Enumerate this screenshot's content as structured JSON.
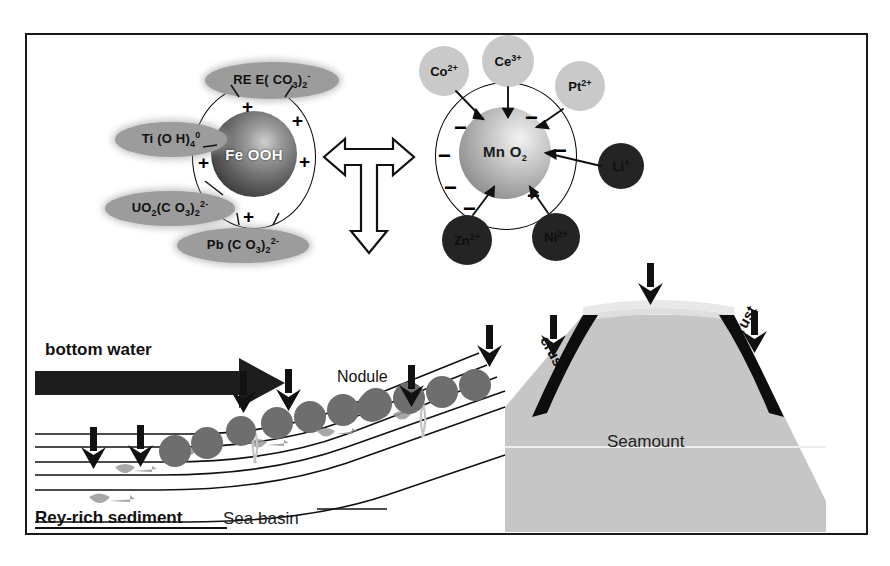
{
  "figure": {
    "border_color": "#1a1a1a"
  },
  "upper_panel": {
    "left_sphere": {
      "core_label": "Fe OOH",
      "surface_charge": "+",
      "charge_count": 5,
      "species": [
        {
          "id": "ree",
          "formula": "REE(CO3)2-",
          "display": "RE E( CO 3)2 -"
        },
        {
          "id": "ti",
          "formula": "Ti(OH)4 0",
          "display": "Ti (O H) 4 0"
        },
        {
          "id": "uo2",
          "formula": "UO2(CO3)2 2-",
          "display": "UO 2(C O 3)2 2-"
        },
        {
          "id": "pb",
          "formula": "Pb(CO3)2 2-",
          "display": "Pb (C O 3)2 2-"
        }
      ]
    },
    "right_sphere": {
      "core_label": "Mn O2",
      "surface_charge": "-",
      "charge_count": 7,
      "species": [
        {
          "id": "co",
          "formula": "Co 2+",
          "shade": "light"
        },
        {
          "id": "ce",
          "formula": "Ce 3+",
          "shade": "light"
        },
        {
          "id": "pt",
          "formula": "Pt 2+",
          "shade": "light"
        },
        {
          "id": "li",
          "formula": "Li +",
          "shade": "dark"
        },
        {
          "id": "zn",
          "formula": "Zn 2+",
          "shade": "dark"
        },
        {
          "id": "ni",
          "formula": "Ni 2+",
          "shade": "dark"
        }
      ]
    },
    "connector": {
      "type": "hollow-tee-arrow",
      "directions": [
        "left",
        "right",
        "down"
      ]
    }
  },
  "lower_panel": {
    "bottom_water_label": "bottom water",
    "nodule_label": "Nodule",
    "seamount_label": "Seamount",
    "crust_label_left": "crust",
    "crust_label_right": "crust",
    "sediment_label": "Rey-rich sediment",
    "basin_label": "Sea basin",
    "settling_arrow_count": 9,
    "nodule_count": 11,
    "colors": {
      "seamount": "#c6c6c6",
      "seamount_cap": "#dedede",
      "crust": "#0d0d0d",
      "nodule": "#6e6e6e",
      "bottom_water_arrow": "#1d1d1d"
    }
  },
  "labels": {
    "fe_core": "Fe OOH",
    "mn_core": "Mn O",
    "mn_core_sub": "2",
    "ree_main": "RE E( CO",
    "ree_sub": "3",
    "ree_close": ")",
    "ree_sub2": "2",
    "ree_sup": "-",
    "ti_main": "Ti (O H)",
    "ti_sub": "4",
    "ti_sup": "0",
    "uo2_a": "UO",
    "uo2_s1": "2",
    "uo2_b": "(C O",
    "uo2_s2": "3",
    "uo2_c": ")",
    "uo2_s3": "2",
    "uo2_sup": "2-",
    "pb_a": "Pb (C O",
    "pb_s1": "3",
    "pb_b": ")",
    "pb_s2": "2",
    "pb_sup": "2-",
    "co_sym": "Co",
    "co_sup": "2+",
    "ce_sym": "Ce",
    "ce_sup": "3+",
    "pt_sym": "Pt",
    "pt_sup": "2+",
    "li_sym": "Li",
    "li_sup": "+",
    "zn_sym": "Zn",
    "zn_sup": "2+",
    "ni_sym": "Ni",
    "ni_sup": "2+",
    "plus": "+",
    "minus": "−"
  }
}
